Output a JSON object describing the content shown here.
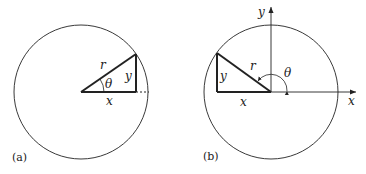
{
  "panels": [
    {
      "caption": "(a)",
      "labels": {
        "r": "r",
        "y": "y",
        "x": "x",
        "theta": "θ"
      }
    },
    {
      "caption": "(b)",
      "labels": {
        "r": "r",
        "y": "y",
        "x": "x",
        "theta": "θ",
        "x_axis": "x",
        "y_axis": "y"
      }
    }
  ],
  "colors": {
    "stroke": "#222222"
  }
}
